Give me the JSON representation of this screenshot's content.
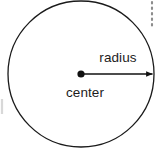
{
  "figure": {
    "background_color": "#ffffff",
    "width": 162,
    "height": 152
  },
  "labels": {
    "radius": "radius",
    "center": "center"
  },
  "shapes": {
    "circle": {
      "name": "circle-outline",
      "center_x": 81,
      "center_y": 74,
      "radius": 73,
      "stroke_color": "#1a1a1a",
      "stroke_width": 1.3,
      "fill": "none"
    },
    "center_point": {
      "name": "center-dot",
      "x": 81,
      "y": 74,
      "dot_radius": 3.6,
      "fill_color": "#111111"
    },
    "radius_arrow": {
      "name": "radius-arrow",
      "x1": 81,
      "y1": 74,
      "x2": 155,
      "y2": 74,
      "stroke_color": "#111111",
      "stroke_width": 1.6,
      "arrowhead": "solid-triangle"
    },
    "dotted_line": {
      "name": "dotted-guide-line",
      "x": 152,
      "y_start": 2,
      "y_end": 26,
      "dot_color": "#8d8d8d",
      "dash_pattern": "1.5 4"
    },
    "edge_tick": {
      "name": "left-edge-tick",
      "x": 2,
      "y_start": 99,
      "y_end": 114,
      "color": "#d8d8d8"
    }
  },
  "label_positions": {
    "radius": {
      "x": 118,
      "y": 62,
      "anchor": "middle"
    },
    "center": {
      "x": 85,
      "y": 97,
      "anchor": "middle"
    }
  }
}
